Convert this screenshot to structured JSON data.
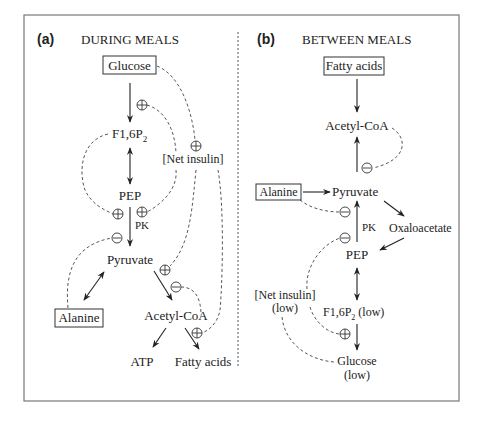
{
  "panel_a": {
    "letter": "(a)",
    "title": "DURING MEALS",
    "nodes": {
      "glucose": "Glucose",
      "f16p2": "F1,6P",
      "f16p2_sub": "2",
      "net_insulin": "[Net insulin]",
      "pep": "PEP",
      "pk": "PK",
      "pyruvate": "Pyruvate",
      "alanine": "Alanine",
      "acetyl_coa": "Acetyl-CoA",
      "atp": "ATP",
      "fatty_acids": "Fatty acids"
    }
  },
  "panel_b": {
    "letter": "(b)",
    "title": "BETWEEN MEALS",
    "nodes": {
      "fatty_acids": "Fatty acids",
      "acetyl_coa": "Acetyl-CoA",
      "alanine": "Alanine",
      "pyruvate": "Pyruvate",
      "pk": "PK",
      "oxaloacetate": "Oxaloacetate",
      "pep": "PEP",
      "net_insulin": "[Net insulin]",
      "net_insulin_low": "(low)",
      "f16p2": "F1,6P",
      "f16p2_sub": "2",
      "f16p2_low": " (low)",
      "glucose": "Glucose",
      "glucose_low": "(low)"
    }
  },
  "signs": {
    "plus": "+",
    "minus": "−"
  }
}
